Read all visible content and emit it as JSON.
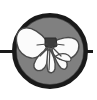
{
  "figure": {
    "kind": "diagram-icon",
    "canvas": {
      "width": 97,
      "height": 100,
      "background": "#ffffff"
    },
    "colors": {
      "background": "#ffffff",
      "disc_fill": "#808080",
      "disc_outline": "#1a1a1a",
      "wing_fill": "#fbfbfb",
      "wing_outline": "#4a4a4a",
      "body_fill": "#3c3c3c",
      "axis_line": "#1a1a1a"
    },
    "disc": {
      "center_x": 50,
      "center_y": 51,
      "radius": 38,
      "stroke_width": 5
    },
    "axis": {
      "y": 51,
      "left_start_x": 0,
      "left_end_x": 16,
      "right_start_x": 84,
      "right_end_x": 93,
      "stroke_width": 3
    },
    "butterfly": {
      "body_center_x": 50,
      "body_center_y": 47,
      "wing_count": 6,
      "segments": [
        "left-forewing",
        "left-hindwing-inner",
        "left-hindwing-outer",
        "right-forewing",
        "right-hindwing-inner",
        "right-hindwing-outer"
      ]
    }
  }
}
